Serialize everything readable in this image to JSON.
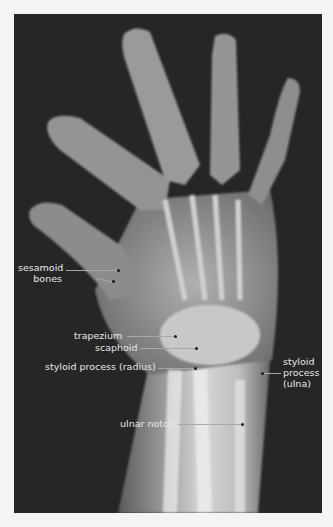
{
  "figure": {
    "background_color": "#262626",
    "page_color": "#f4f4f2",
    "label_color": "#e8e8e8"
  },
  "labels": {
    "sesamoid_line1": "sesamoid",
    "sesamoid_line2": "bones",
    "trapezium": "trapezium",
    "scaphoid": "scaphoid",
    "styloid_radius": "styloid process (radius)",
    "styloid_ulna_line1": "styloid",
    "styloid_ulna_line2": "process",
    "styloid_ulna_line3": "(ulna)",
    "ulnar_notch": "ulnar notch"
  }
}
